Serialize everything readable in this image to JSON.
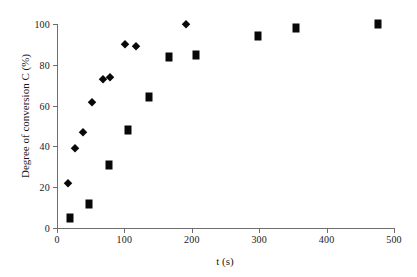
{
  "chart_data": {
    "type": "scatter",
    "title": "",
    "xlabel": "t (s)",
    "ylabel": "Degree of conversion C (%)",
    "xlim": [
      0,
      500
    ],
    "ylim": [
      0,
      100
    ],
    "xticks": [
      0,
      100,
      200,
      300,
      400,
      500
    ],
    "yticks": [
      0,
      20,
      40,
      60,
      80,
      100
    ],
    "xtick_labels": [
      "0",
      "100",
      "200",
      "300",
      "400",
      "500"
    ],
    "ytick_labels": [
      "0",
      "20",
      "40",
      "60",
      "80",
      "100"
    ],
    "grid": false,
    "legend": "none",
    "series": [
      {
        "name": "series-diamond",
        "marker": "diamond",
        "color": "#080808",
        "points": [
          {
            "x": 16,
            "y": 22
          },
          {
            "x": 26,
            "y": 39
          },
          {
            "x": 38,
            "y": 47
          },
          {
            "x": 52,
            "y": 62
          },
          {
            "x": 68,
            "y": 73
          },
          {
            "x": 79,
            "y": 74
          },
          {
            "x": 101,
            "y": 90
          },
          {
            "x": 117,
            "y": 89
          },
          {
            "x": 191,
            "y": 100
          }
        ]
      },
      {
        "name": "series-square",
        "marker": "square",
        "color": "#080808",
        "points": [
          {
            "x": 19,
            "y": 5
          },
          {
            "x": 47,
            "y": 12
          },
          {
            "x": 77,
            "y": 31
          },
          {
            "x": 105,
            "y": 48
          },
          {
            "x": 136,
            "y": 64
          },
          {
            "x": 166,
            "y": 84
          },
          {
            "x": 206,
            "y": 85
          },
          {
            "x": 298,
            "y": 94
          },
          {
            "x": 355,
            "y": 98
          },
          {
            "x": 476,
            "y": 100
          }
        ]
      }
    ]
  }
}
